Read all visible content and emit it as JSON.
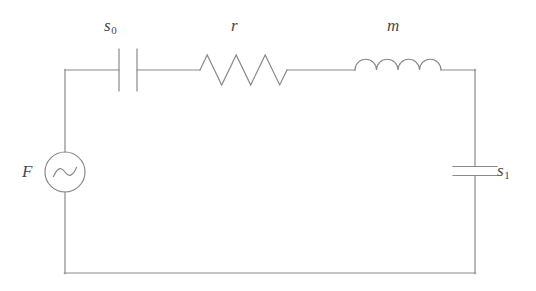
{
  "diagram": {
    "type": "electrical-circuit-schematic",
    "background_color": "#ffffff",
    "line_color": "#8a8a8a",
    "label_color": "#4a4a4a",
    "line_width": 1.2
  },
  "labels": {
    "source": "F",
    "capacitor_top": "s",
    "capacitor_top_sub": "0",
    "resistor": "r",
    "inductor": "m",
    "capacitor_right": "s",
    "capacitor_right_sub": "1"
  },
  "components": [
    {
      "name": "ac-voltage-source",
      "symbol": "circle-with-sine",
      "label": "F",
      "label_position": "left",
      "position": {
        "cx": 65,
        "cy": 172,
        "r": 20
      }
    },
    {
      "name": "capacitor-s0",
      "symbol": "parallel-plate-vertical",
      "label": "s0",
      "label_position": "above",
      "position": {
        "cx": 128,
        "cy": 70,
        "plate_gap": 9,
        "plate_half_height": 21
      }
    },
    {
      "name": "resistor-r",
      "symbol": "zigzag",
      "label": "r",
      "label_position": "above",
      "position": {
        "x_start": 200,
        "x_end": 287,
        "cy": 70,
        "amplitude": 15,
        "peaks": 3
      }
    },
    {
      "name": "inductor-m",
      "symbol": "coil-arcs",
      "label": "m",
      "label_position": "above",
      "position": {
        "x_start": 355,
        "x_end": 441,
        "cy": 70,
        "arcs": 4,
        "arc_radius": 10.75
      }
    },
    {
      "name": "capacitor-s1",
      "symbol": "parallel-plate-horizontal",
      "label": "s1",
      "label_position": "right",
      "position": {
        "cx": 475,
        "cy": 171,
        "plate_gap": 9,
        "plate_half_width": 22
      }
    }
  ],
  "wires": {
    "loop": {
      "left_x": 65,
      "right_x": 475,
      "top_y": 70,
      "bottom_y": 273
    },
    "segments": [
      {
        "name": "top-left-wire",
        "from": [
          65,
          70
        ],
        "to": [
          119,
          70
        ]
      },
      {
        "name": "top-mid-wire-1",
        "from": [
          137,
          70
        ],
        "to": [
          200,
          70
        ]
      },
      {
        "name": "top-mid-wire-2",
        "from": [
          287,
          70
        ],
        "to": [
          355,
          70
        ]
      },
      {
        "name": "top-right-wire",
        "from": [
          441,
          70
        ],
        "to": [
          475,
          70
        ]
      },
      {
        "name": "left-wire-upper",
        "from": [
          65,
          70
        ],
        "to": [
          65,
          152
        ]
      },
      {
        "name": "left-wire-lower",
        "from": [
          65,
          192
        ],
        "to": [
          65,
          273
        ]
      },
      {
        "name": "right-wire-upper",
        "from": [
          475,
          70
        ],
        "to": [
          475,
          166
        ]
      },
      {
        "name": "right-wire-lower",
        "from": [
          475,
          176
        ],
        "to": [
          475,
          273
        ]
      },
      {
        "name": "bottom-wire",
        "from": [
          65,
          273
        ],
        "to": [
          475,
          273
        ]
      }
    ]
  }
}
